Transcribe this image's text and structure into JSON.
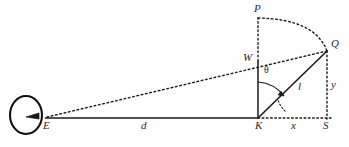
{
  "figure": {
    "type": "geometry-diagram",
    "background_color": "#fefefe",
    "stroke_color": "#1a1a1a",
    "width": 349,
    "height": 147
  },
  "points": {
    "E": {
      "label": "E",
      "x": 47,
      "y": 118,
      "label_x": 43,
      "label_y": 120
    },
    "K": {
      "label": "K",
      "x": 258,
      "y": 118,
      "label_x": 255,
      "label_y": 120
    },
    "S": {
      "label": "S",
      "x": 327,
      "y": 118,
      "label_x": 323,
      "label_y": 120
    },
    "W": {
      "label": "W",
      "x": 258,
      "y": 62,
      "label_x": 243,
      "label_y": 55
    },
    "P": {
      "label": "P",
      "x": 258,
      "y": 18,
      "label_x": 255,
      "label_y": 5
    },
    "Q": {
      "label": "Q",
      "x": 327,
      "y": 51,
      "label_x": 331,
      "label_y": 40
    }
  },
  "segment_labels": {
    "d": {
      "text": "d",
      "x": 141,
      "y": 120
    },
    "x": {
      "text": "x",
      "x": 291,
      "y": 120
    },
    "y": {
      "text": "y",
      "x": 331,
      "y": 80
    },
    "l": {
      "text": "l",
      "x": 299,
      "y": 83
    },
    "theta": {
      "text": "θ",
      "x": 264,
      "y": 71
    }
  },
  "elements": {
    "eye": {
      "name": "eye-ellipse",
      "cx": 26,
      "cy": 115,
      "rx": 16,
      "ry": 19
    },
    "eye_arrow": {
      "name": "eye-pupil-arrow"
    },
    "arc_PQ": {
      "name": "arc-p-to-q"
    },
    "angle_arc_theta": {
      "name": "angle-arc-theta"
    },
    "angle_arc_k": {
      "name": "angle-arc-k-lower"
    }
  },
  "lines": {
    "baseline_EKS": {
      "style": "solid",
      "from": "E",
      "to": "S"
    },
    "sightline_EQ": {
      "style": "dotted",
      "from": "E",
      "to": "Q"
    },
    "KW_vertical": {
      "style": "solid",
      "from": "K",
      "to": "W"
    },
    "WP_vertical": {
      "style": "dotted",
      "from": "W",
      "to": "P"
    },
    "KQ_radius": {
      "style": "solid",
      "from": "K",
      "to": "Q"
    },
    "QS_vertical": {
      "style": "dotted",
      "from": "Q",
      "to": "S"
    },
    "KS_horizontal": {
      "style": "dotted",
      "from": "K",
      "to": "S"
    }
  }
}
